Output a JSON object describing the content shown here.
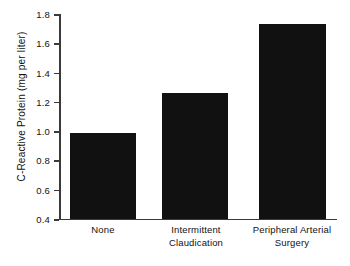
{
  "chart_data": {
    "type": "bar",
    "title": "",
    "subtitle": "",
    "xlabel": "",
    "ylabel": "C-Reactive Protein (mg per liter)",
    "categories": [
      "None",
      "Intermittent Claudication",
      "Peripheral Arterial Surgery"
    ],
    "category_lines": [
      [
        "None"
      ],
      [
        "Intermittent",
        "Claudication"
      ],
      [
        "Peripheral Arterial",
        "Surgery"
      ]
    ],
    "values": [
      0.99,
      1.26,
      1.73
    ],
    "ylim": [
      0.4,
      1.8
    ],
    "yticks": [
      0.4,
      0.6,
      0.8,
      1.0,
      1.2,
      1.4,
      1.6,
      1.8
    ],
    "ytick_labels": [
      "0.4",
      "0.6",
      "0.8",
      "1.0",
      "1.2",
      "1.4",
      "1.6",
      "1.8"
    ],
    "grid": false,
    "legend": false,
    "legend_position": "none",
    "bar_color": "#111111",
    "axis_color": "#3a3a3a",
    "background_color": "#ffffff"
  }
}
